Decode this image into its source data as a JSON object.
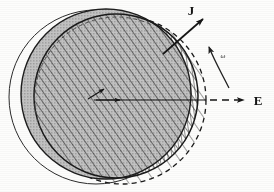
{
  "figure": {
    "background_color": "#fdfdfc",
    "ink_color": "#151515",
    "shade_color": "#b9b9b9",
    "labels": {
      "current_density": "J",
      "angular_velocity": "ω",
      "electric_field": "E"
    },
    "elements": {
      "outline_circle": {
        "name": "thin-outline-circle",
        "cx": 96,
        "cy": 97,
        "r": 87,
        "stroke": "#2b2b2b",
        "fill": "none",
        "dash": "none"
      },
      "gray_sphere": {
        "name": "gray-filled-sphere",
        "cx": 106,
        "cy": 94,
        "r": 85,
        "fill": "#b9b9b9",
        "stroke": "#1d1d1d"
      },
      "hatched_sphere": {
        "name": "diagonal-hatched-sphere",
        "cx": 116,
        "cy": 96,
        "r": 82,
        "fill": "diagonal-hatch",
        "stroke": "#1a1a1a",
        "dash": "none"
      },
      "dashed_sphere": {
        "name": "dashed-outline-hatched-sphere",
        "cx": 122,
        "cy": 100,
        "r": 84,
        "fill": "sparse-diagonal-hatch",
        "stroke": "#1a1a1a",
        "dash": "5 4"
      },
      "crescent_top": {
        "name": "vertical-hatched-crescent",
        "fill": "vertical-hatch"
      }
    },
    "vectors": {
      "J": {
        "name": "current-density-vector",
        "x1": 163,
        "y1": 54,
        "x2": 205,
        "y2": 17,
        "label_x": 194,
        "label_y": 14,
        "style": "solid-arrow"
      },
      "E": {
        "name": "electric-field-vector",
        "x1": 94,
        "y1": 100,
        "x2": 248,
        "y2": 100,
        "label_x": 257,
        "label_y": 105,
        "style": "solid-then-dashed-arrow",
        "dash_start": 206
      },
      "omega": {
        "name": "angular-velocity-arc-arrow",
        "arc_start_x": 224,
        "arc_start_y": 84,
        "arc_end_x": 208,
        "arc_end_y": 43,
        "label_x": 224,
        "label_y": 56,
        "style": "curved-arrow"
      },
      "center_small": {
        "name": "center-small-vector",
        "x1": 92,
        "y1": 97,
        "x2": 108,
        "y2": 88,
        "style": "small-solid-arrow"
      },
      "center_mid": {
        "name": "center-mid-arrowhead",
        "x1": 94,
        "y1": 100,
        "x2": 122,
        "y2": 100,
        "style": "small-solid-arrow"
      }
    },
    "inner_dashed_arc": {
      "name": "inner-dashed-arc",
      "cx": 116,
      "cy": 96,
      "r": 82,
      "dash": "4 3"
    }
  }
}
